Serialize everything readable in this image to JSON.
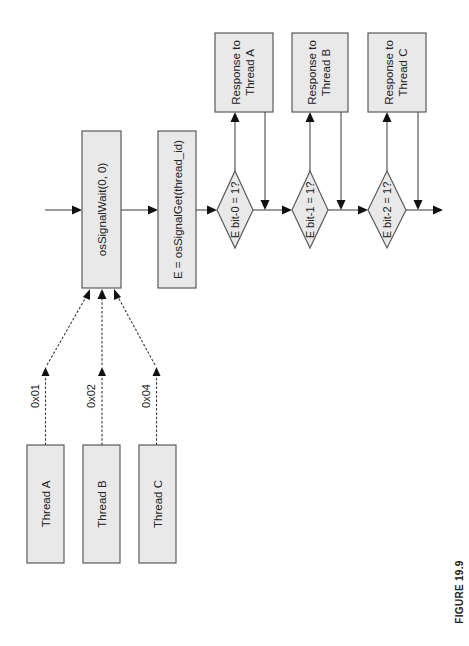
{
  "figure": {
    "caption": "FIGURE 19.9",
    "orientation": "rotated 90° counter-clockwise (landscape flowchart)"
  },
  "threads": [
    {
      "label": "Thread A",
      "signal": "0x01"
    },
    {
      "label": "Thread B",
      "signal": "0x02"
    },
    {
      "label": "Thread C",
      "signal": "0x04"
    }
  ],
  "process": {
    "wait": "osSignalWait(0, 0)",
    "get": "E = osSignalGet(thread_id)"
  },
  "decisions": [
    {
      "label": "E bit-0 = 1?",
      "response_line1": "Response to",
      "response_line2": "Thread A"
    },
    {
      "label": "E bit-1 = 1?",
      "response_line1": "Response to",
      "response_line2": "Thread B"
    },
    {
      "label": "E bit-2 = 1?",
      "response_line1": "Response to",
      "response_line2": "Thread C"
    }
  ],
  "colors": {
    "box_fill": "#e9e9e9",
    "box_stroke": "#5a5a5a",
    "arrow": "#111111"
  }
}
